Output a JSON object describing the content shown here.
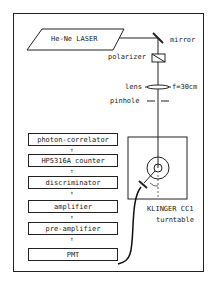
{
  "laser": {
    "label": "He-Ne LASER"
  },
  "optics": {
    "mirror": "mirror",
    "polarizer": "polarizer",
    "lens": "lens",
    "focal_length": "f=30cm",
    "pinhole": "pinhole"
  },
  "chain": [
    {
      "label": "photon-correlator"
    },
    {
      "label": "HP5316A counter"
    },
    {
      "label": "discriminator"
    },
    {
      "label": "amplifier"
    },
    {
      "label": "pre-amplifier"
    },
    {
      "label": "PMT"
    }
  ],
  "turntable": {
    "line1": "KLINGER CC1",
    "line2": "turntable"
  },
  "arrow_glyph": "⇑"
}
